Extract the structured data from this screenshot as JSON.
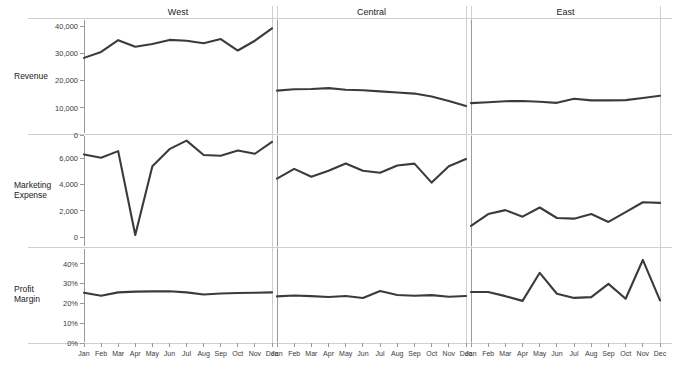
{
  "chart_data": {
    "type": "line",
    "title": "",
    "subtitle": "",
    "layout": "small-multiples 3 rows x 3 columns",
    "grid": false,
    "legend": "none",
    "xlabel": "",
    "x": [
      "Jan",
      "Feb",
      "Mar",
      "Apr",
      "May",
      "Jun",
      "Jul",
      "Aug",
      "Sep",
      "Oct",
      "Nov",
      "Dec"
    ],
    "columns": [
      "West",
      "Central",
      "East"
    ],
    "rows": [
      {
        "label": "Revenue",
        "ylabel": "Revenue",
        "ylim": [
          0,
          40000
        ],
        "yticks": [
          0,
          10000,
          20000,
          30000,
          40000
        ],
        "ytick_labels": [
          "0",
          "10,000",
          "20,000",
          "30,000",
          "40,000"
        ],
        "series": [
          {
            "name": "West",
            "values": [
              28300,
              30500,
              34800,
              32400,
              33400,
              34900,
              34600,
              33700,
              35200,
              31000,
              34600,
              39100
            ]
          },
          {
            "name": "Central",
            "values": [
              16300,
              16800,
              16900,
              17200,
              16600,
              16400,
              16000,
              15600,
              15200,
              14100,
              12500,
              10600
            ]
          },
          {
            "name": "East",
            "values": [
              11700,
              12000,
              12400,
              12500,
              12200,
              11800,
              13300,
              12700,
              12700,
              12800,
              13600,
              14400
            ]
          }
        ]
      },
      {
        "label": "Marketing Expense",
        "ylabel": "Marketing Expense",
        "ylim": [
          0,
          7400
        ],
        "yticks": [
          0,
          2000,
          4000,
          6000
        ],
        "ytick_labels": [
          "0",
          "2,000",
          "4,000",
          "6,000"
        ],
        "series": [
          {
            "name": "West",
            "values": [
              6300,
              6050,
              6550,
              150,
              5400,
              6700,
              7350,
              6250,
              6200,
              6600,
              6350,
              7250
            ]
          },
          {
            "name": "Central",
            "values": [
              4450,
              5200,
              4600,
              5050,
              5600,
              5050,
              4900,
              5450,
              5600,
              4150,
              5400,
              5950
            ]
          },
          {
            "name": "East",
            "values": [
              850,
              1750,
              2050,
              1550,
              2250,
              1450,
              1400,
              1750,
              1150,
              1900,
              2650,
              2600
            ]
          }
        ]
      },
      {
        "label": "Profit Margin",
        "ylabel": "Profit Margin",
        "ylim": [
          0,
          0.44
        ],
        "yticks": [
          0,
          0.1,
          0.2,
          0.3,
          0.4
        ],
        "ytick_labels": [
          "0%",
          "10%",
          "20%",
          "30%",
          "40%"
        ],
        "series": [
          {
            "name": "West",
            "values": [
              0.254,
              0.239,
              0.256,
              0.26,
              0.261,
              0.262,
              0.256,
              0.245,
              0.25,
              0.253,
              0.254,
              0.256
            ]
          },
          {
            "name": "Central",
            "values": [
              0.236,
              0.24,
              0.237,
              0.233,
              0.238,
              0.228,
              0.263,
              0.243,
              0.239,
              0.242,
              0.234,
              0.238
            ]
          },
          {
            "name": "East",
            "values": [
              0.258,
              0.258,
              0.237,
              0.213,
              0.355,
              0.249,
              0.228,
              0.232,
              0.299,
              0.224,
              0.42,
              0.216
            ]
          }
        ]
      }
    ]
  },
  "accessibility": {
    "line_color": "#3b3b3b",
    "rule_color": "#cfcfcf",
    "axis_color": "#9a9a9a",
    "background": "#ffffff"
  }
}
